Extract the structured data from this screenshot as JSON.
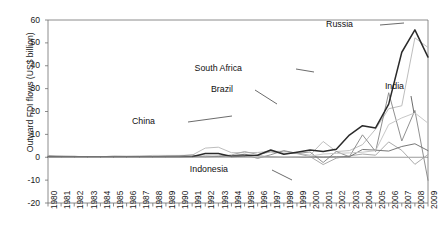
{
  "chart_data": {
    "type": "line",
    "title": "",
    "xlabel": "",
    "ylabel": "Outward FDI flows (US$ billion)",
    "ylim": [
      -20,
      60
    ],
    "yticks": [
      -20,
      -10,
      0,
      10,
      20,
      30,
      40,
      50,
      60
    ],
    "grid": false,
    "legend_position": "inline-annotations",
    "x": [
      1980,
      1981,
      1982,
      1983,
      1984,
      1985,
      1986,
      1987,
      1988,
      1989,
      1990,
      1991,
      1992,
      1993,
      1994,
      1995,
      1996,
      1997,
      1998,
      1999,
      2000,
      2001,
      2002,
      2003,
      2004,
      2005,
      2006,
      2007,
      2008,
      2009
    ],
    "categories": [
      "1980",
      "1981",
      "1982",
      "1983",
      "1984",
      "1985",
      "1986",
      "1987",
      "1988",
      "1989",
      "1990",
      "1991",
      "1992",
      "1993",
      "1994",
      "1995",
      "1996",
      "1997",
      "1998",
      "1999",
      "2000",
      "2001",
      "2002",
      "2003",
      "2004",
      "2005",
      "2006",
      "2007",
      "2008",
      "2009"
    ],
    "series": [
      {
        "name": "China",
        "color": "#b9b9b9",
        "values": [
          0.1,
          0.5,
          0.4,
          0.1,
          0.1,
          0.6,
          0.5,
          0.6,
          0.8,
          0.8,
          0.8,
          0.9,
          4.0,
          4.4,
          2.0,
          2.0,
          2.1,
          2.6,
          2.6,
          1.8,
          0.9,
          6.9,
          2.5,
          2.9,
          5.5,
          12.3,
          21.2,
          22.5,
          52.2,
          48.0
        ]
      },
      {
        "name": "Brazil",
        "color": "#8a8a8a",
        "values": [
          0.4,
          0.3,
          0.4,
          0.2,
          0.1,
          0.1,
          0.2,
          0.2,
          0.2,
          0.5,
          0.6,
          1.0,
          0.1,
          0.5,
          0.7,
          1.1,
          -0.5,
          1.1,
          2.9,
          1.7,
          2.3,
          -2.3,
          2.5,
          0.2,
          9.8,
          2.5,
          28.2,
          7.1,
          20.5,
          -10.1
        ]
      },
      {
        "name": "South Africa",
        "color": "#a5a5a5",
        "values": [
          0.8,
          0.5,
          0.3,
          0.2,
          0.1,
          0.1,
          0.2,
          0.1,
          0.1,
          0.2,
          0.1,
          0.2,
          0.6,
          0.4,
          1.0,
          2.5,
          1.2,
          2.3,
          1.8,
          1.6,
          0.3,
          -3.2,
          -0.4,
          0.6,
          1.4,
          0.9,
          6.7,
          3.0,
          -3.1,
          1.2
        ]
      },
      {
        "name": "Indonesia",
        "color": "#707070",
        "values": [
          0.1,
          0.1,
          0.1,
          0.1,
          0.1,
          0.1,
          0.1,
          0.1,
          0.1,
          0.1,
          0.1,
          0.1,
          0.1,
          0.3,
          0.6,
          1.3,
          0.6,
          0.2,
          0.0,
          0.1,
          0.2,
          0.1,
          0.2,
          0.2,
          3.4,
          3.1,
          2.7,
          4.7,
          5.9,
          2.9
        ]
      },
      {
        "name": "Russia",
        "color": "#2b2b2b",
        "values": [
          0.0,
          0.0,
          0.0,
          0.0,
          0.0,
          0.0,
          0.0,
          0.0,
          0.0,
          0.0,
          0.0,
          0.2,
          1.6,
          1.6,
          0.3,
          0.6,
          0.9,
          3.2,
          1.3,
          2.2,
          3.2,
          2.5,
          3.5,
          9.7,
          13.8,
          12.8,
          23.2,
          45.9,
          55.7,
          43.8
        ]
      },
      {
        "name": "India",
        "color": "#c4c4c4",
        "values": [
          0.0,
          0.0,
          0.0,
          0.0,
          0.0,
          0.0,
          0.0,
          0.0,
          0.0,
          0.0,
          0.0,
          0.0,
          0.0,
          0.0,
          0.1,
          0.1,
          0.2,
          0.1,
          0.0,
          0.1,
          0.5,
          1.4,
          1.7,
          1.9,
          2.2,
          2.9,
          14.3,
          17.2,
          19.4,
          14.9
        ]
      }
    ],
    "annotations": [
      {
        "label": "China",
        "x": 155,
        "y": 122
      },
      {
        "label": "Brazil",
        "x": 233,
        "y": 90
      },
      {
        "label": "South Africa",
        "x": 242,
        "y": 69
      },
      {
        "label": "Indonesia",
        "x": 228,
        "y": 170
      },
      {
        "label": "Russia",
        "x": 353,
        "y": 25
      },
      {
        "label": "India",
        "x": 404,
        "y": 87
      }
    ]
  },
  "axis": {
    "y_title": "Outward FDI flows (US$ billion)",
    "y_tick_labels": [
      "60",
      "50",
      "40",
      "30",
      "20",
      "10",
      "0",
      "-10",
      "-20"
    ],
    "x_tick_labels": [
      "1980",
      "1981",
      "1982",
      "1983",
      "1984",
      "1985",
      "1986",
      "1987",
      "1988",
      "1989",
      "1990",
      "1991",
      "1992",
      "1993",
      "1994",
      "1995",
      "1996",
      "1997",
      "1998",
      "1999",
      "2000",
      "2001",
      "2002",
      "2003",
      "2004",
      "2005",
      "2006",
      "2007",
      "2008",
      "2009"
    ]
  },
  "series_labels": {
    "china": "China",
    "brazil": "Brazil",
    "south_africa": "South Africa",
    "indonesia": "Indonesia",
    "russia": "Russia",
    "india": "India"
  },
  "colors": {
    "china": "#b9b9b9",
    "brazil": "#8a8a8a",
    "south_africa": "#a5a5a5",
    "indonesia": "#707070",
    "russia": "#2b2b2b",
    "india": "#c4c4c4",
    "axis": "#6f6f6f",
    "text": "#1a1a1a"
  }
}
